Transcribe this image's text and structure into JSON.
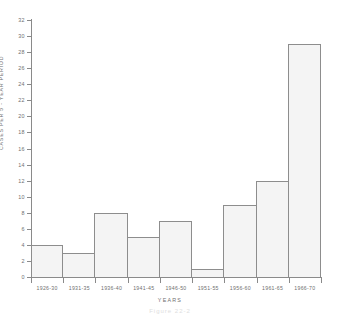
{
  "chart_data": {
    "type": "bar",
    "title": "",
    "xlabel": "YEARS",
    "ylabel": "CASES PER 5 - YEAR PERIOD",
    "categories": [
      "1926-30",
      "1931-35",
      "1936-40",
      "1941-45",
      "1946-50",
      "1951-55",
      "1956-60",
      "1961-65",
      "1966-70"
    ],
    "values": [
      4,
      3,
      8,
      5,
      7,
      1,
      9,
      12,
      29
    ],
    "ylim": [
      0,
      32
    ],
    "ytick_values": [
      0,
      2,
      4,
      6,
      8,
      10,
      12,
      14,
      16,
      18,
      20,
      22,
      24,
      26,
      28,
      30,
      32
    ],
    "ytick_labels": [
      "0",
      "2",
      "4",
      "6",
      "8",
      "10",
      "12",
      "14",
      "16",
      "18",
      "20",
      "22",
      "24",
      "26",
      "28",
      "30",
      "32"
    ],
    "grid": false,
    "legend": null,
    "bar_fill_color": "#f4f4f4",
    "bar_border_color": "#8d8d8d",
    "axis_color": "#8a8a8a",
    "text_color": "#6f6f6f",
    "background_color": "#ffffff"
  },
  "caption": {
    "text": "Figure 22-2"
  }
}
